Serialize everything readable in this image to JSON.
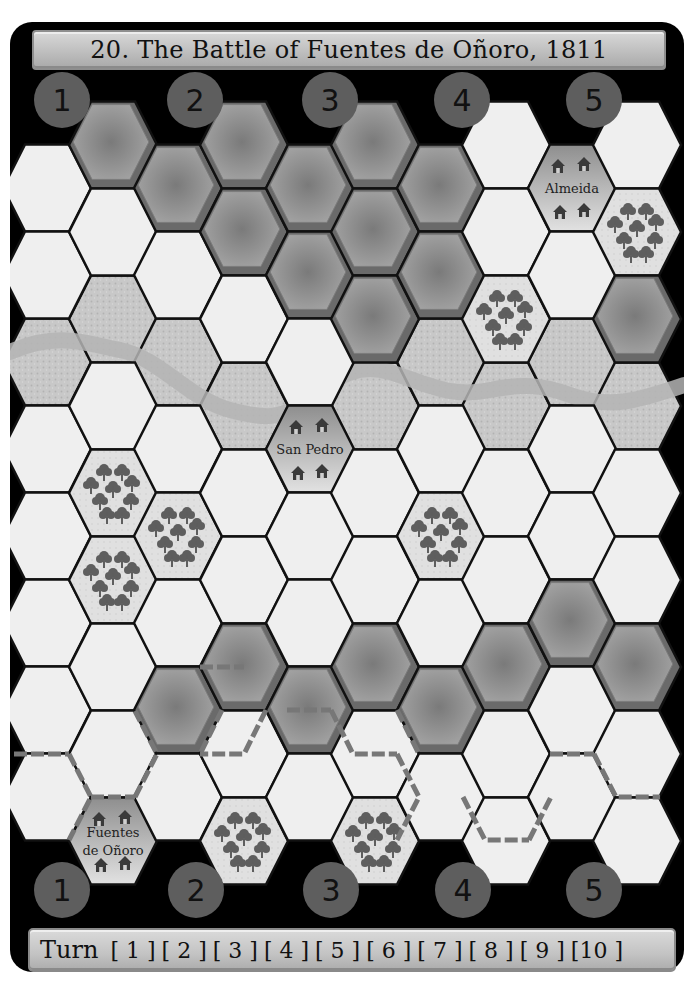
{
  "title": "20. The Battle of Fuentes de Oñoro, 1811",
  "colors": {
    "board_bg": "#000000",
    "clear": "#efefef",
    "stipple": "#c9c9c9",
    "river": "#bdbdbd",
    "hill": "#8f8f8f",
    "hill_dark": "#6a6a6a",
    "woods_bg": "#dedede",
    "tree": "#5e5e5e",
    "town": "#a8a8a8",
    "hedge": "#777777",
    "circle": "#5e5e5e"
  },
  "sector_markers": {
    "top": [
      {
        "label": "1",
        "x": 62,
        "y": 100
      },
      {
        "label": "2",
        "x": 195,
        "y": 100
      },
      {
        "label": "3",
        "x": 330,
        "y": 100
      },
      {
        "label": "4",
        "x": 462,
        "y": 100
      },
      {
        "label": "5",
        "x": 594,
        "y": 100
      }
    ],
    "bottom": [
      {
        "label": "1",
        "x": 62,
        "y": 890
      },
      {
        "label": "2",
        "x": 196,
        "y": 890
      },
      {
        "label": "3",
        "x": 331,
        "y": 890
      },
      {
        "label": "4",
        "x": 463,
        "y": 890
      },
      {
        "label": "5",
        "x": 594,
        "y": 890
      }
    ]
  },
  "grid": {
    "hex_w": 88,
    "hex_h": 87,
    "col_x": [
      47,
      113,
      178,
      244,
      310,
      375,
      441,
      506,
      572,
      637
    ],
    "even_col_y0": 188,
    "odd_col_y0": 145,
    "row_step": 87,
    "columns": [
      [
        "clear",
        "clear",
        "river",
        "clear",
        "clear",
        "clear",
        "clear",
        "clear"
      ],
      [
        "hill",
        "clear",
        "river",
        "clear",
        "woods",
        "woods",
        "clear",
        "clear",
        "town:Fuentes de Oñoro"
      ],
      [
        "hill",
        "clear",
        "river",
        "clear",
        "woods",
        "clear",
        "hill",
        "clear"
      ],
      [
        "hill",
        "hill",
        "clear",
        "river",
        "clear",
        "clear",
        "hill",
        "clear",
        "woods"
      ],
      [
        "hill",
        "hill",
        "clear",
        "town:San Pedro",
        "clear",
        "clear",
        "hill",
        "clear"
      ],
      [
        "hill",
        "hill",
        "hill",
        "river",
        "clear",
        "clear",
        "hill",
        "clear",
        "woods"
      ],
      [
        "hill",
        "hill",
        "river",
        "clear",
        "woods",
        "clear",
        "hill",
        "clear"
      ],
      [
        "clear",
        "clear",
        "woods",
        "river",
        "clear",
        "clear",
        "hill",
        "clear",
        "clear"
      ],
      [
        "town:Almeida",
        "clear",
        "river",
        "clear",
        "clear",
        "hill",
        "clear",
        "clear"
      ],
      [
        "clear",
        "woods",
        "hill",
        "river",
        "clear",
        "clear",
        "hill",
        "clear",
        "clear"
      ]
    ]
  },
  "towns": [
    {
      "name": "Almeida",
      "col": 8,
      "row": 0
    },
    {
      "name": "San Pedro",
      "col": 4,
      "row": 3
    },
    {
      "name": "Fuentes de Oñoro",
      "col": 1,
      "row": 8
    }
  ],
  "river_path": "M10,352 C60,330 90,345 120,350 C160,358 190,400 230,410 C260,418 280,420 300,405 C330,385 350,360 390,372 C430,385 450,398 490,390 C520,384 540,384 570,395 C610,410 640,400 684,385",
  "hedges": [
    "M14,754 L69,754",
    "M69,754 L91,797 L69,840",
    "M91,797 L135,797",
    "M135,797 L157,754 L135,711",
    "M200,667 L244,667",
    "M266,710 L244,754 L200,754",
    "M222,710 L200,754",
    "M287,710 L331,710",
    "M331,710 L353,754 L397,754",
    "M397,710 L419,754",
    "M397,754 L419,797 L397,840",
    "M463,797 L485,840 L529,840",
    "M529,840 L551,797",
    "M550,754 L594,754",
    "M594,754 L616,797 L660,797"
  ],
  "turn_track": {
    "label": "Turn",
    "turns": [
      "[ 1 ]",
      "[ 2 ]",
      "[ 3 ]",
      "[ 4 ]",
      "[ 5 ]",
      "[ 6 ]",
      "[ 7 ]",
      "[ 8 ]",
      "[ 9 ]",
      "[10 ]"
    ]
  }
}
